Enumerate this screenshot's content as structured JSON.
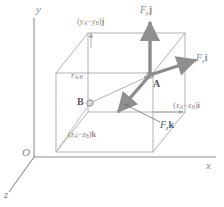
{
  "figure": {
    "axes": {
      "y_label": "y",
      "x_label": "x",
      "z_label": "z",
      "origin_label": "O"
    },
    "points": {
      "a_label": "A",
      "b_label": "B"
    },
    "vectors": [
      {
        "name": "force-y",
        "base": "F",
        "sub": "y",
        "unit": "j",
        "text": "Fᵧ j"
      },
      {
        "name": "force-x",
        "base": "F",
        "sub": "x",
        "unit": "i",
        "text": "Fₓ i"
      },
      {
        "name": "force-z",
        "base": "F",
        "sub": "z",
        "unit": "k",
        "text": "Fₓ k"
      },
      {
        "name": "position-vector",
        "base": "r",
        "sub": "A/B",
        "unit": "",
        "text": "r_A/B"
      }
    ],
    "components": {
      "y_component": {
        "open": "(",
        "first": "y",
        "first_sub": "A",
        "minus": "−",
        "second": "y",
        "second_sub": "B",
        "close": ")",
        "unit": "j"
      },
      "x_component": {
        "open": "(",
        "first": "x",
        "first_sub": "A",
        "minus": "−",
        "second": "x",
        "second_sub": "B",
        "close": ")",
        "unit": "i"
      },
      "z_component": {
        "open": "(",
        "first": "z",
        "first_sub": "A",
        "minus": "−",
        "second": "z",
        "second_sub": "B",
        "close": ")",
        "unit": "k"
      }
    },
    "colors": {
      "line": "#9b9b9b",
      "box": "#a8a8a8",
      "vector": "#8c8c8c",
      "text": "#8a8a8a",
      "background": "#ffffff"
    }
  }
}
